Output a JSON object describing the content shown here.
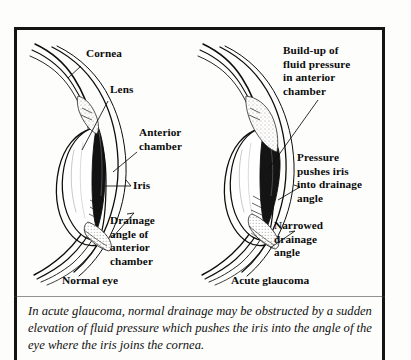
{
  "figure": {
    "caption": "In acute glaucoma, normal drainage may be obstructed by a sudden elevation of fluid pressure which pushes the iris into the angle of the eye where the iris joins the cornea."
  },
  "normal_eye": {
    "title": "Normal eye",
    "labels": {
      "cornea": "Cornea",
      "lens": "Lens",
      "anterior_chamber": "Anterior\nchamber",
      "iris": "Iris",
      "drainage_angle": "Drainage\nangle of\nanterior\nchamber"
    }
  },
  "glaucoma_eye": {
    "title": "Acute glaucoma",
    "labels": {
      "buildup": "Build-up of\nfluid pressure\nin anterior\nchamber",
      "pressure": "Pressure\npushes iris\ninto drainage\nangle",
      "narrowed": "Narrowed\ndrainage\nangle"
    }
  },
  "colors": {
    "ink": "#0b0b0b",
    "frame": "#141414",
    "paper": "#fdfdfb",
    "stipple": "#c9c6be"
  }
}
